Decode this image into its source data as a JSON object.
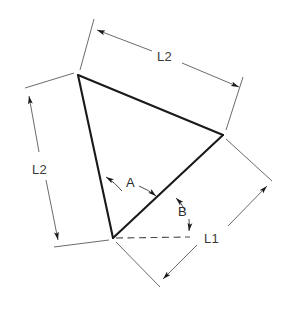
{
  "diagram": {
    "background_color": "#ffffff",
    "line_color": "#1a1a1a",
    "dimension_color": "#5a5a5a",
    "labels": {
      "top_dimension": "L2",
      "left_dimension": "L2",
      "right_dimension": "L1",
      "angle_a": "A",
      "angle_b": "B"
    },
    "vertices": {
      "top": {
        "x": 78,
        "y": 75
      },
      "right": {
        "x": 223,
        "y": 135
      },
      "bottom": {
        "x": 113,
        "y": 238
      }
    },
    "edges": [
      {
        "name": "top-edge",
        "from": "top",
        "to": "right",
        "dimension": "L2"
      },
      {
        "name": "left-edge",
        "from": "top",
        "to": "bottom",
        "dimension": "L2"
      },
      {
        "name": "bottom-edge",
        "from": "bottom",
        "to": "right",
        "dimension": "L1"
      }
    ],
    "angles": [
      {
        "name": "A",
        "at": "bottom",
        "between": [
          "left-edge",
          "bottom-edge"
        ]
      },
      {
        "name": "B",
        "at": "bottom",
        "between": [
          "bottom-edge",
          "baseline"
        ]
      }
    ],
    "baseline": {
      "name": "horizontal-reference",
      "style": "dashed",
      "from": {
        "x": 113,
        "y": 238
      },
      "to": {
        "x": 190,
        "y": 237
      }
    }
  }
}
